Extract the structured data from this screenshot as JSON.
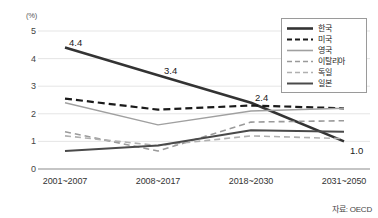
{
  "chart_data": {
    "type": "line",
    "title": "",
    "subtitle": "",
    "unit_label": "(%)",
    "xlabel": "",
    "ylabel": "",
    "ylim": [
      0,
      5
    ],
    "yticks": [
      0,
      1,
      2,
      3,
      4,
      5
    ],
    "ytick_labels": [
      "0",
      "1",
      "2",
      "3",
      "4",
      "5"
    ],
    "grid": true,
    "legend_position": "top-right",
    "categories": [
      "2001~2007",
      "2008~2017",
      "2018~2030",
      "2031~2050"
    ],
    "series": [
      {
        "name": "한국",
        "values": [
          4.4,
          3.4,
          2.4,
          1.0
        ],
        "style": "solid",
        "color": "#333333",
        "width": 2.6,
        "labeled": true,
        "point_labels": [
          "4.4",
          "3.4",
          "2.4",
          "1.0"
        ]
      },
      {
        "name": "미국",
        "values": [
          2.55,
          2.15,
          2.3,
          2.2
        ],
        "style": "dashed",
        "color": "#1a1a1a",
        "width": 2.2,
        "labeled": false,
        "point_labels": []
      },
      {
        "name": "영국",
        "values": [
          2.4,
          1.6,
          2.1,
          2.2
        ],
        "style": "solid",
        "color": "#a0a0a0",
        "width": 1.4,
        "labeled": false,
        "point_labels": []
      },
      {
        "name": "이탈리아",
        "values": [
          1.35,
          0.65,
          1.7,
          1.75
        ],
        "style": "dashed",
        "color": "#9a9a9a",
        "width": 1.6,
        "labeled": false,
        "point_labels": []
      },
      {
        "name": "독일",
        "values": [
          1.2,
          0.85,
          1.2,
          1.1
        ],
        "style": "dashed",
        "color": "#b0b0b0",
        "width": 1.6,
        "labeled": false,
        "point_labels": []
      },
      {
        "name": "일본",
        "values": [
          0.65,
          0.85,
          1.4,
          1.35
        ],
        "style": "solid",
        "color": "#4a4a4a",
        "width": 2.0,
        "labeled": false,
        "point_labels": []
      }
    ],
    "annotations": [
      {
        "text": "4.4",
        "x_index": 0,
        "y": 4.4,
        "dx": 4,
        "dy": -11
      },
      {
        "text": "3.4",
        "x_index": 1,
        "y": 3.4,
        "dx": 6,
        "dy": -10
      },
      {
        "text": "2.4",
        "x_index": 2,
        "y": 2.4,
        "dx": 4,
        "dy": -11
      },
      {
        "text": "1.0",
        "x_index": 3,
        "y": 1.0,
        "dx": 6,
        "dy": 4
      }
    ],
    "source": "자료: OECD"
  }
}
